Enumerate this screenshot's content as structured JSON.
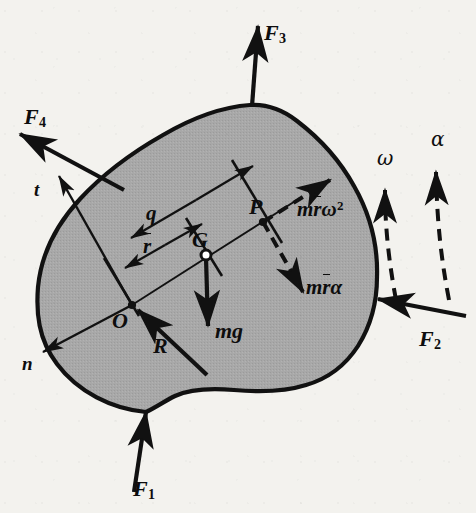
{
  "figure": {
    "body_fill": "#a8a8a8",
    "outline_color": "#111111",
    "background": "#f3f2ee",
    "ink_color": "#0d0d0d"
  },
  "labels": {
    "force_1": {
      "base": "F",
      "sub": "1",
      "text": "F1"
    },
    "force_2": {
      "base": "F",
      "sub": "2",
      "text": "F2"
    },
    "force_3": {
      "base": "F",
      "sub": "3",
      "text": "F3"
    },
    "force_4": {
      "base": "F",
      "sub": "4",
      "text": "F4"
    },
    "point_O": "O",
    "point_G": "G",
    "point_P": "P",
    "reaction_R": "R",
    "weight_mg": "mg",
    "axis_t": "t",
    "axis_n": "n",
    "dim_q": "q",
    "dim_rbar": "r",
    "normal_accel": {
      "m": "m",
      "rbar": "r",
      "omega": "ω",
      "exp": "2",
      "text": "mr̄ω²"
    },
    "tangential_accel": {
      "m": "m",
      "rbar": "r",
      "alpha": "α",
      "text": "mr̄α"
    },
    "angular_velocity": "ω",
    "angular_acceleration": "α"
  },
  "geometry": {
    "point_O": {
      "x": 132,
      "y": 305
    },
    "point_G": {
      "x": 206,
      "y": 255
    },
    "point_P": {
      "x": 263,
      "y": 222
    },
    "note": "O is the reference point, G the mass center, P the point of interest on line OG extended"
  }
}
